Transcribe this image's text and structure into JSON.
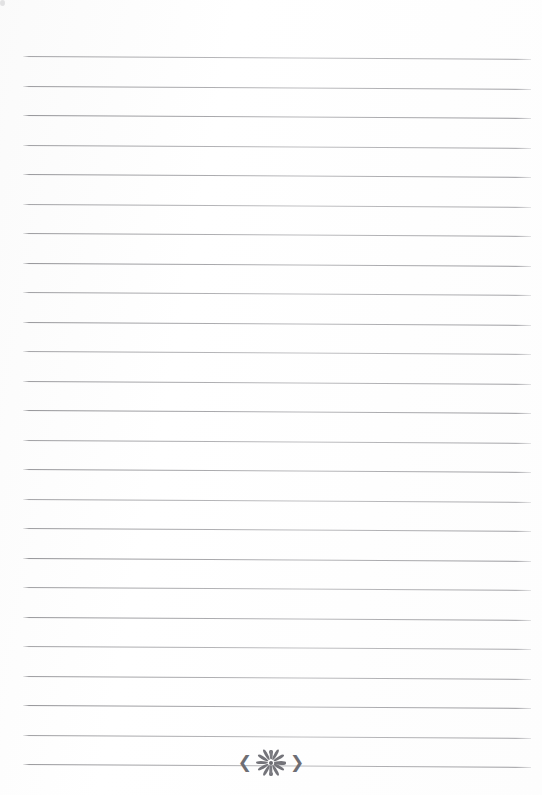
{
  "document": {
    "type": "lined-stationery-page",
    "title": "Blank lined notebook page",
    "page_width": 542,
    "page_height": 795,
    "background_color": "#fefefe",
    "rule_color": "#8a8a8e",
    "text_content": "",
    "written_text_lines": []
  },
  "ruling": {
    "line_count": 25,
    "first_line_y": 56,
    "line_spacing": 29.5,
    "line_left_x": 23,
    "line_right_x": 531,
    "line_thickness": 1,
    "slant_px_over_width": 3,
    "line_positions_y": [
      56,
      85.5,
      115,
      144.5,
      174,
      203.5,
      233,
      262.5,
      292,
      321.5,
      351,
      380.5,
      410,
      439.5,
      469,
      498.5,
      528,
      557.5,
      587,
      616.5,
      646,
      675.5,
      705,
      734.5,
      764
    ]
  },
  "ornament": {
    "name": "floral-starburst-divider",
    "description": "Decorative sunburst flower with radiating petals flanked by left and right arrow brackets, centered on the final ruled line",
    "center_x": 271,
    "center_y": 763,
    "width": 80,
    "height": 26,
    "color": "#74747a",
    "left_bracket": "❮",
    "right_bracket": "❯",
    "petal_count": 12,
    "has_center_dot": true,
    "has_top_dot": true,
    "has_bottom_dot": true
  },
  "artifacts": {
    "scan_speck": {
      "name": "scan-speck",
      "x": 231,
      "y": 4,
      "color": "#cdcdd0"
    }
  }
}
